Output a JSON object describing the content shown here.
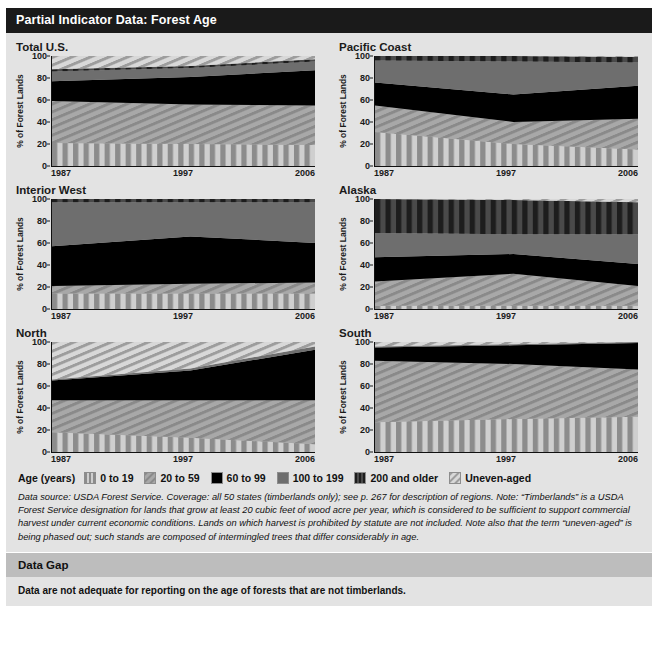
{
  "header": {
    "title": "Partial Indicator Data: Forest Age"
  },
  "axis": {
    "ylabel": "% of Forest Lands",
    "yticks": [
      "0",
      "20",
      "40",
      "60",
      "80",
      "100"
    ],
    "xticks": [
      "1987",
      "1997",
      "2006"
    ]
  },
  "legend": {
    "label": "Age (years)",
    "items": [
      {
        "name": "0 to 19",
        "pattern": "vertical-stripe",
        "color": "#9a9a9a"
      },
      {
        "name": "20 to 59",
        "pattern": "diagonal-hatch",
        "color": "#9a9a9a"
      },
      {
        "name": "60 to 99",
        "pattern": "solid-black",
        "color": "#000000"
      },
      {
        "name": "100 to 199",
        "pattern": "solid-gray",
        "color": "#6e6e6e"
      },
      {
        "name": "200 and older",
        "pattern": "dark-vertical-stripe",
        "color": "#3a3a3a"
      },
      {
        "name": "Uneven-aged",
        "pattern": "light-diagonal-hatch",
        "color": "#c9c9c9"
      }
    ]
  },
  "notes": "Data source: USDA Forest Service. Coverage: all 50 states (timberlands only); see p. 267 for description of regions. Note: “Timberlands” is a USDA Forest Service designation for lands that grow at least 20 cubic feet of wood acre per year, which is considered to be sufficient to support commercial harvest under current economic conditions. Lands on which harvest is prohibited by statute are not included. Note also that the term “uneven-aged” is being phased out; such stands are composed of intermingled trees that differ considerably in age.",
  "data_gap": {
    "heading": "Data Gap",
    "text": "Data are not adequate for reporting on the age of forests that are not timberlands."
  },
  "chart_data": {
    "type": "area",
    "title": "Partial Indicator Data: Forest Age",
    "xlabel": "",
    "ylabel": "% of Forest Lands",
    "ylim": [
      0,
      100
    ],
    "x": [
      1987,
      1997,
      2006
    ],
    "xtick_labels": [
      "1987",
      "1997",
      "2006"
    ],
    "grid": false,
    "legend_position": "bottom",
    "stacked": true,
    "series_order": [
      "0 to 19",
      "20 to 59",
      "60 to 99",
      "100 to 199",
      "200 and older",
      "Uneven-aged"
    ],
    "panels": [
      {
        "title": "Total U.S.",
        "series": [
          {
            "name": "0 to 19",
            "values": [
              21,
              20,
              19
            ]
          },
          {
            "name": "20 to 59",
            "values": [
              38,
              36,
              36
            ]
          },
          {
            "name": "60 to 99",
            "values": [
              18,
              25,
              32
            ]
          },
          {
            "name": "100 to 199",
            "values": [
              9,
              8,
              8
            ]
          },
          {
            "name": "200 and older",
            "values": [
              2,
              2,
              2
            ]
          },
          {
            "name": "Uneven-aged",
            "values": [
              12,
              9,
              3
            ]
          }
        ],
        "cumulative_tops": {
          "1987": [
            21,
            59,
            77,
            86,
            88,
            100
          ],
          "1997": [
            20,
            56,
            81,
            89,
            91,
            100
          ],
          "2006": [
            19,
            55,
            87,
            95,
            97,
            100
          ]
        }
      },
      {
        "title": "Pacific Coast",
        "series": [
          {
            "name": "0 to 19",
            "values": [
              31,
              20,
              15
            ]
          },
          {
            "name": "20 to 59",
            "values": [
              24,
              20,
              28
            ]
          },
          {
            "name": "60 to 99",
            "values": [
              21,
              25,
              30
            ]
          },
          {
            "name": "100 to 199",
            "values": [
              20,
              30,
              21
            ]
          },
          {
            "name": "200 and older",
            "values": [
              4,
              5,
              5
            ]
          },
          {
            "name": "Uneven-aged",
            "values": [
              0,
              0,
              1
            ]
          }
        ],
        "cumulative_tops": {
          "1987": [
            31,
            55,
            76,
            96,
            100,
            100
          ],
          "1997": [
            20,
            40,
            65,
            95,
            100,
            100
          ],
          "2006": [
            15,
            43,
            73,
            94,
            99,
            100
          ]
        }
      },
      {
        "title": "Interior West",
        "series": [
          {
            "name": "0 to 19",
            "values": [
              14,
              14,
              14
            ]
          },
          {
            "name": "20 to 59",
            "values": [
              7,
              9,
              10
            ]
          },
          {
            "name": "60 to 99",
            "values": [
              36,
              43,
              36
            ]
          },
          {
            "name": "100 to 199",
            "values": [
              40,
              31,
              37
            ]
          },
          {
            "name": "200 and older",
            "values": [
              3,
              3,
              3
            ]
          },
          {
            "name": "Uneven-aged",
            "values": [
              0,
              0,
              0
            ]
          }
        ],
        "cumulative_tops": {
          "1987": [
            14,
            21,
            57,
            97,
            100,
            100
          ],
          "1997": [
            14,
            23,
            66,
            97,
            100,
            100
          ],
          "2006": [
            14,
            24,
            60,
            97,
            100,
            100
          ]
        }
      },
      {
        "title": "Alaska",
        "series": [
          {
            "name": "0 to 19",
            "values": [
              3,
              3,
              3
            ]
          },
          {
            "name": "20 to 59",
            "values": [
              22,
              29,
              18
            ]
          },
          {
            "name": "60 to 99",
            "values": [
              22,
              18,
              20
            ]
          },
          {
            "name": "100 to 199",
            "values": [
              22,
              18,
              27
            ]
          },
          {
            "name": "200 and older",
            "values": [
              31,
              31,
              29
            ]
          },
          {
            "name": "Uneven-aged",
            "values": [
              0,
              1,
              3
            ]
          }
        ],
        "cumulative_tops": {
          "1987": [
            3,
            25,
            47,
            69,
            100,
            100
          ],
          "1997": [
            3,
            32,
            50,
            68,
            99,
            100
          ],
          "2006": [
            3,
            21,
            41,
            68,
            97,
            100
          ]
        }
      },
      {
        "title": "North",
        "series": [
          {
            "name": "0 to 19",
            "values": [
              18,
              13,
              7
            ]
          },
          {
            "name": "20 to 59",
            "values": [
              29,
              34,
              40
            ]
          },
          {
            "name": "60 to 99",
            "values": [
              18,
              27,
              46
            ]
          },
          {
            "name": "100 to 199",
            "values": [
              1,
              2,
              3
            ]
          },
          {
            "name": "200 and older",
            "values": [
              0,
              0,
              0
            ]
          },
          {
            "name": "Uneven-aged",
            "values": [
              34,
              24,
              4
            ]
          }
        ],
        "cumulative_tops": {
          "1987": [
            18,
            47,
            65,
            66,
            66,
            100
          ],
          "1997": [
            13,
            47,
            74,
            76,
            76,
            100
          ],
          "2006": [
            7,
            47,
            93,
            96,
            96,
            100
          ]
        }
      },
      {
        "title": "South",
        "series": [
          {
            "name": "0 to 19",
            "values": [
              27,
              30,
              32
            ]
          },
          {
            "name": "20 to 59",
            "values": [
              56,
              50,
              43
            ]
          },
          {
            "name": "60 to 99",
            "values": [
              12,
              17,
              24
            ]
          },
          {
            "name": "100 to 199",
            "values": [
              1,
              1,
              1
            ]
          },
          {
            "name": "200 and older",
            "values": [
              0,
              0,
              0
            ]
          },
          {
            "name": "Uneven-aged",
            "values": [
              4,
              2,
              0
            ]
          }
        ],
        "cumulative_tops": {
          "1987": [
            27,
            83,
            95,
            96,
            96,
            100
          ],
          "1997": [
            30,
            80,
            97,
            98,
            98,
            100
          ],
          "2006": [
            32,
            75,
            99,
            100,
            100,
            100
          ]
        }
      }
    ]
  }
}
